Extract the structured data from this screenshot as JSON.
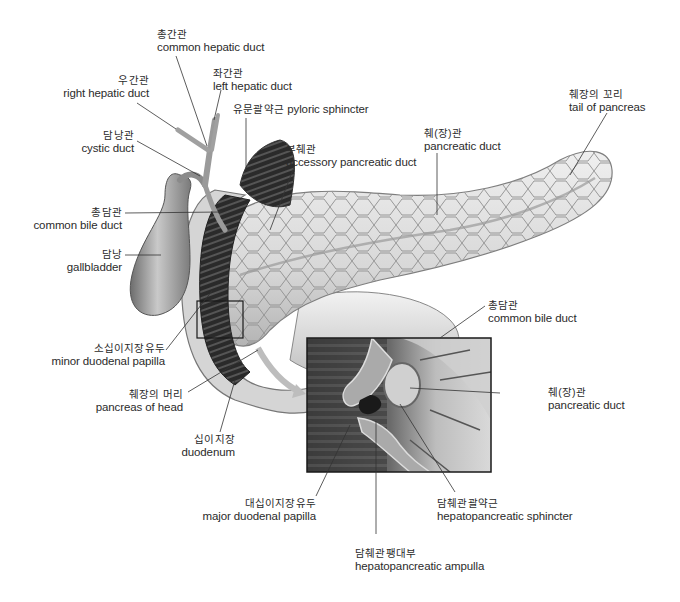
{
  "diagram": {
    "inset": {
      "x": 307,
      "y": 338,
      "w": 184,
      "h": 134
    },
    "zoom_box": {
      "x": 197,
      "y": 301,
      "w": 46,
      "h": 37
    },
    "labels": [
      {
        "id": "common-hepatic-duct",
        "ko": "총간관",
        "en": "common hepatic duct"
      },
      {
        "id": "left-hepatic-duct",
        "ko": "좌간관",
        "en": "left hepatic duct"
      },
      {
        "id": "right-hepatic-duct",
        "ko": "우간관",
        "en": "right hepatic duct"
      },
      {
        "id": "pyloric-sphincter",
        "ko": "유문괄약근",
        "en": "pyloric sphincter"
      },
      {
        "id": "cystic-duct",
        "ko": "담낭관",
        "en": "cystic duct"
      },
      {
        "id": "accessory-pancreatic-duct",
        "ko": "부췌관",
        "en": "accessory pancreatic duct"
      },
      {
        "id": "pancreatic-duct-top",
        "ko": "췌(장)관",
        "en": "pancreatic duct"
      },
      {
        "id": "tail-of-pancreas",
        "ko": "췌장의 꼬리",
        "en": "tail of pancreas"
      },
      {
        "id": "common-bile-duct-left",
        "ko": "총담관",
        "en": "common bile duct"
      },
      {
        "id": "gallbladder",
        "ko": "담낭",
        "en": "gallbladder"
      },
      {
        "id": "minor-duodenal-papilla",
        "ko": "소십이지장유두",
        "en": "minor duodenal papilla"
      },
      {
        "id": "pancreas-of-head",
        "ko": "췌장의 머리",
        "en": "pancreas of head"
      },
      {
        "id": "duodenum",
        "ko": "십이지장",
        "en": "duodenum"
      },
      {
        "id": "common-bile-duct-inset",
        "ko": "총담관",
        "en": "common bile duct"
      },
      {
        "id": "pancreatic-duct-inset",
        "ko": "췌(장)관",
        "en": "pancreatic duct"
      },
      {
        "id": "major-duodenal-papilla",
        "ko": "대십이지장유두",
        "en": "major duodenal papilla"
      },
      {
        "id": "hepatopancreatic-sphincter",
        "ko": "담췌관괄약근",
        "en": "hepatopancreatic sphincter"
      },
      {
        "id": "hepatopancreatic-ampulla",
        "ko": "담췌관팽대부",
        "en": "hepatopancreatic ampulla"
      }
    ]
  }
}
